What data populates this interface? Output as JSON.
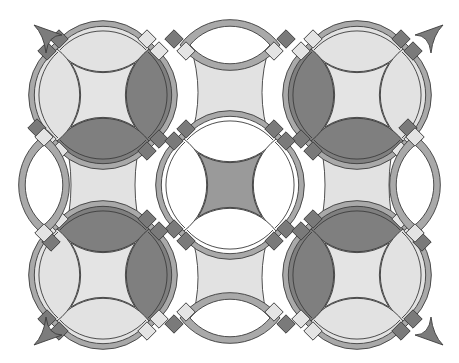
{
  "figure": {
    "width": 459,
    "height": 363,
    "background": "#ffffff"
  },
  "palette": {
    "band": "#a9a9a9",
    "band_light": "#b6b6b6",
    "lens_dark": "#7f7f7f",
    "lens_light": "#e2e2e2",
    "center_light": "#e4e4e4",
    "center_dark": "#9a9a9a",
    "connector": "#e2e2e2",
    "square_dark": "#7a7a7a",
    "square_light": "#e4e4e4",
    "stroke": "#3c3c3c",
    "corner_triangle": "#7c7c7c"
  },
  "rings": [
    {
      "id": "ring-top-left",
      "cx": 103,
      "cy": 95,
      "center": "center_light",
      "lens": {
        "top": "lens_light",
        "right": "lens_dark",
        "bottom": "lens_dark",
        "left": "lens_light"
      },
      "squares": {
        "tl": "dark",
        "tr": "light",
        "br": "dark",
        "bl": "light"
      }
    },
    {
      "id": "ring-top-right",
      "cx": 357,
      "cy": 95,
      "center": "center_light",
      "lens": {
        "top": "lens_light",
        "right": "lens_light",
        "bottom": "lens_dark",
        "left": "lens_dark"
      },
      "squares": {
        "tl": "light",
        "tr": "dark",
        "br": "light",
        "bl": "dark"
      }
    },
    {
      "id": "ring-center",
      "cx": 230,
      "cy": 185,
      "center": "center_dark",
      "lens": {
        "top": "white",
        "right": "white",
        "bottom": "white",
        "left": "white"
      },
      "squares": {
        "tl": "dark",
        "tr": "dark",
        "br": "dark",
        "bl": "dark"
      }
    },
    {
      "id": "ring-bottom-left",
      "cx": 103,
      "cy": 275,
      "center": "center_light",
      "lens": {
        "top": "lens_dark",
        "right": "lens_dark",
        "bottom": "lens_light",
        "left": "lens_light"
      },
      "squares": {
        "tl": "light",
        "tr": "dark",
        "br": "light",
        "bl": "dark"
      }
    },
    {
      "id": "ring-bottom-right",
      "cx": 357,
      "cy": 275,
      "center": "center_light",
      "lens": {
        "top": "lens_dark",
        "right": "lens_light",
        "bottom": "lens_light",
        "left": "lens_dark"
      },
      "squares": {
        "tl": "dark",
        "tr": "light",
        "br": "dark",
        "bl": "light"
      }
    }
  ],
  "partial_arcs": [
    {
      "id": "arc-top-middle",
      "cx": 230,
      "cy": 5,
      "orientation": "horizontal"
    },
    {
      "id": "arc-bottom-middle",
      "cx": 230,
      "cy": 365,
      "orientation": "horizontal"
    },
    {
      "id": "arc-left-middle",
      "cx": -15,
      "cy": 185,
      "orientation": "vertical"
    },
    {
      "id": "arc-right-middle",
      "cx": 474,
      "cy": 185,
      "orientation": "vertical"
    }
  ],
  "corner_triangles": [
    {
      "id": "triangle-top-left",
      "x": 42,
      "y": 27,
      "dir": "tl"
    },
    {
      "id": "triangle-top-right",
      "x": 417,
      "y": 27,
      "dir": "tr"
    },
    {
      "id": "triangle-bottom-left",
      "x": 42,
      "y": 343,
      "dir": "bl"
    },
    {
      "id": "triangle-bottom-right",
      "x": 417,
      "y": 343,
      "dir": "br"
    }
  ]
}
